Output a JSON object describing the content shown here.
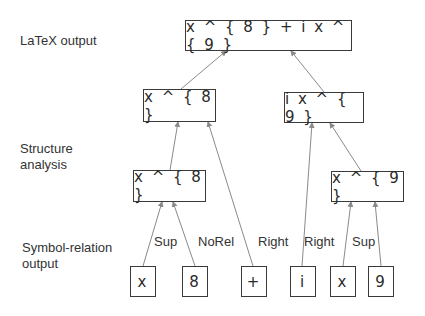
{
  "levels": {
    "latex": "LaTeX output",
    "structure_line1": "Structure",
    "structure_line2": "analysis",
    "symbol_line1": "Symbol-relation",
    "symbol_line2": "output"
  },
  "nodes": {
    "root": "x ^ { 8 } + i x ^ { 9 }",
    "mid_left": "x ^ { 8 }",
    "mid_right": "i x ^ { 9 }",
    "low_left": "x ^ { 8 }",
    "low_right": "x ^ { 9 }",
    "sym_x1": "x",
    "sym_8": "8",
    "sym_plus": "+",
    "sym_i": "i",
    "sym_x2": "x",
    "sym_9": "9"
  },
  "relations": {
    "x_8": "Sup",
    "low_left_plus": "NoRel",
    "plus": "Right",
    "i": "Right",
    "x_9": "Sup"
  },
  "colors": {
    "edge": "#8a8a8a",
    "box_border": "#3a3a3a",
    "text": "#2a2a2a"
  }
}
